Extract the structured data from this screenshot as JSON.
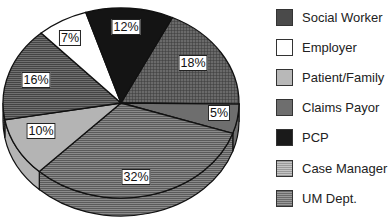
{
  "chart_data": {
    "type": "pie",
    "style": "3d-pie",
    "title": "",
    "legend_position": "right",
    "slices": [
      {
        "label": "Social Worker",
        "value": 18,
        "display": "18%",
        "color": "#5a5a5a",
        "pattern": "grid"
      },
      {
        "label": "Claims Payor",
        "value": 5,
        "display": "5%",
        "color": "#6e6e6e",
        "pattern": "solid"
      },
      {
        "label": "UM Dept.",
        "value": 32,
        "display": "32%",
        "color": "#7d7d7d",
        "pattern": "hlines"
      },
      {
        "label": "Patient/Family",
        "value": 10,
        "display": "10%",
        "color": "#b4b4b4",
        "pattern": "solid"
      },
      {
        "label": "Case Manager",
        "value": 16,
        "display": "16%",
        "color": "#6a6a6a",
        "pattern": "hlines"
      },
      {
        "label": "Employer",
        "value": 7,
        "display": "7%",
        "color": "#ffffff",
        "pattern": "solid"
      },
      {
        "label": "PCP",
        "value": 12,
        "display": "12%",
        "color": "#141414",
        "pattern": "solid"
      }
    ],
    "legend": [
      {
        "label": "Social Worker",
        "color": "#4a4a4a",
        "pattern": "grid"
      },
      {
        "label": "Employer",
        "color": "#ffffff",
        "pattern": "solid"
      },
      {
        "label": "Patient/Family",
        "color": "#b8b8b8",
        "pattern": "solid"
      },
      {
        "label": "Claims Payor",
        "color": "#6e6e6e",
        "pattern": "solid"
      },
      {
        "label": "PCP",
        "color": "#1a1a1a",
        "pattern": "solid"
      },
      {
        "label": "Case Manager",
        "color": "#9a9a9a",
        "pattern": "hlines"
      },
      {
        "label": "UM Dept.",
        "color": "#7a7a7a",
        "pattern": "hlines"
      }
    ]
  }
}
